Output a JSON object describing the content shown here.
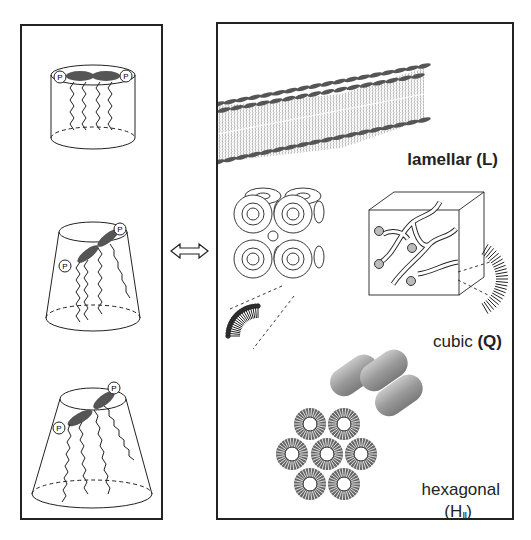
{
  "figure": {
    "left_panel": {
      "title": "lipid molecular shapes",
      "shapes": [
        {
          "name": "cylinder",
          "headgroup_label": "P",
          "tails": 4
        },
        {
          "name": "truncated-cone",
          "headgroup_label": "P",
          "tails": 4
        },
        {
          "name": "wide-truncated-cone",
          "headgroup_label": "P",
          "tails": 4
        }
      ]
    },
    "arrow": {
      "symbol": "⇔",
      "meaning": "double-headed-arrow"
    },
    "right_panel": {
      "phases": [
        {
          "name": "lamellar",
          "label": "lamellar (L)"
        },
        {
          "name": "cubic",
          "label_text": "cubic",
          "label_symbol": "(Q)"
        },
        {
          "name": "hexagonal",
          "label_text": "hexagonal",
          "label_open": "(H",
          "label_sub": "II",
          "label_close": ")"
        }
      ]
    },
    "colors": {
      "outline": "#222222",
      "headgroup": "#555555",
      "tube": "#9a9a9a",
      "background": "#ffffff"
    }
  }
}
